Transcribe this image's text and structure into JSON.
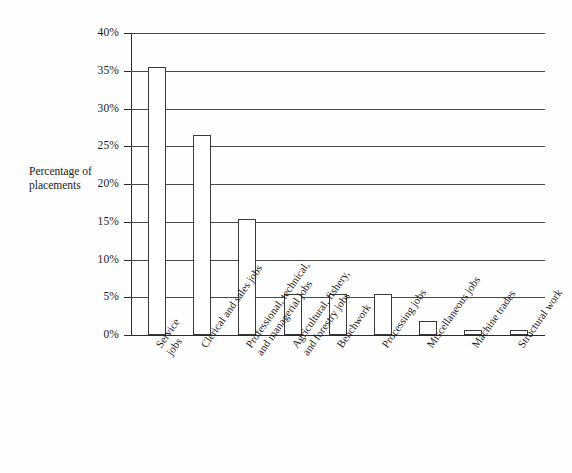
{
  "chart_data": {
    "type": "bar",
    "title": "",
    "xlabel": "",
    "ylabel": "Percentage of placements",
    "ylim": [
      0,
      40
    ],
    "grid": true,
    "legend": "none",
    "ytick_labels": [
      "40%",
      "35%",
      "30%",
      "25%",
      "20%",
      "15%",
      "10%",
      "5%",
      "0%"
    ],
    "ytick_values": [
      40,
      35,
      30,
      25,
      20,
      15,
      10,
      5,
      0
    ],
    "categories": [
      "Service\njobs",
      "Clerical and sales jobs",
      "Professional, technical,\nand managerial jobs",
      "Agricultural, fishery,\nand forestry jobs",
      "Benchwork",
      "Processing jobs",
      "Miscellaneous jobs",
      "Machine trades",
      "Structural work"
    ],
    "values": [
      35.5,
      26.5,
      15.4,
      5.4,
      5.4,
      5.4,
      1.9,
      0.6,
      0.6
    ]
  },
  "axis": {
    "y_title_line1": "Percentage of",
    "y_title_line2": "placements"
  }
}
